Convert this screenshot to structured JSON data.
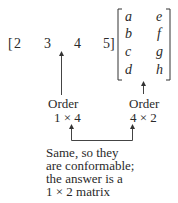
{
  "row_vector": {
    "open_bracket": "[",
    "elements": [
      "2",
      "3",
      "4",
      "5"
    ],
    "close_bracket": "]"
  },
  "matrix": {
    "rows": [
      [
        "a",
        "e"
      ],
      [
        "b",
        "f"
      ],
      [
        "c",
        "g"
      ],
      [
        "d",
        "h"
      ]
    ]
  },
  "left_label": {
    "title": "Order",
    "value": "1 × 4"
  },
  "right_label": {
    "title": "Order",
    "value": "4 × 2"
  },
  "note": {
    "lines": [
      "Same, so they",
      "are conformable;",
      "the answer is a",
      "1 × 2 matrix"
    ]
  }
}
